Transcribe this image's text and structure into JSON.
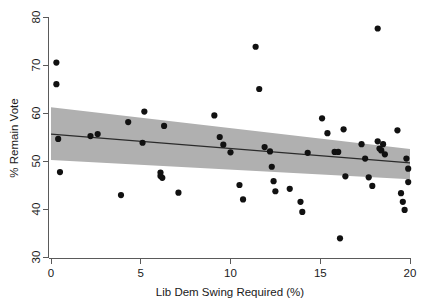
{
  "chart_data": {
    "type": "scatter",
    "title": "",
    "xlabel": "Lib Dem Swing Required (%)",
    "ylabel": "% Remain Vote",
    "xlim": [
      0,
      20
    ],
    "ylim": [
      30,
      80
    ],
    "xticks": [
      0,
      5,
      10,
      15,
      20
    ],
    "yticks": [
      30,
      40,
      50,
      60,
      70,
      80
    ],
    "xtick_labels": [
      "0",
      "5",
      "10",
      "15",
      "20"
    ],
    "ytick_labels": [
      "30",
      "40",
      "50",
      "60",
      "70",
      "80"
    ],
    "grid": false,
    "legend": "none",
    "marker_color": "#111111",
    "fit_line_color": "#2b2b2b",
    "ci_band_color": "#b0b0b0",
    "axis_color": "#5a5a5a",
    "background_color": "#ffffff",
    "points": [
      {
        "x": 0.3,
        "y": 70.5
      },
      {
        "x": 0.3,
        "y": 66.0
      },
      {
        "x": 0.4,
        "y": 54.6
      },
      {
        "x": 0.5,
        "y": 47.7
      },
      {
        "x": 2.2,
        "y": 55.2
      },
      {
        "x": 2.6,
        "y": 55.6
      },
      {
        "x": 3.9,
        "y": 42.9
      },
      {
        "x": 4.3,
        "y": 58.1
      },
      {
        "x": 5.1,
        "y": 53.8
      },
      {
        "x": 5.2,
        "y": 60.3
      },
      {
        "x": 6.1,
        "y": 47.6
      },
      {
        "x": 6.1,
        "y": 46.9
      },
      {
        "x": 6.2,
        "y": 46.5
      },
      {
        "x": 6.3,
        "y": 57.3
      },
      {
        "x": 7.1,
        "y": 43.4
      },
      {
        "x": 9.1,
        "y": 59.5
      },
      {
        "x": 9.4,
        "y": 55.0
      },
      {
        "x": 9.6,
        "y": 53.4
      },
      {
        "x": 10.0,
        "y": 51.8
      },
      {
        "x": 10.5,
        "y": 45.0
      },
      {
        "x": 10.7,
        "y": 42.0
      },
      {
        "x": 11.4,
        "y": 73.8
      },
      {
        "x": 11.6,
        "y": 65.0
      },
      {
        "x": 11.9,
        "y": 52.9
      },
      {
        "x": 12.2,
        "y": 52.0
      },
      {
        "x": 12.3,
        "y": 48.8
      },
      {
        "x": 12.4,
        "y": 45.8
      },
      {
        "x": 12.5,
        "y": 43.7
      },
      {
        "x": 13.3,
        "y": 44.2
      },
      {
        "x": 13.9,
        "y": 41.5
      },
      {
        "x": 14.0,
        "y": 39.4
      },
      {
        "x": 14.3,
        "y": 51.7
      },
      {
        "x": 15.1,
        "y": 58.9
      },
      {
        "x": 15.4,
        "y": 55.8
      },
      {
        "x": 15.8,
        "y": 51.9
      },
      {
        "x": 16.0,
        "y": 51.9
      },
      {
        "x": 16.1,
        "y": 33.9
      },
      {
        "x": 16.3,
        "y": 56.6
      },
      {
        "x": 16.4,
        "y": 46.8
      },
      {
        "x": 17.3,
        "y": 53.5
      },
      {
        "x": 17.5,
        "y": 50.5
      },
      {
        "x": 17.7,
        "y": 46.6
      },
      {
        "x": 17.9,
        "y": 44.8
      },
      {
        "x": 18.2,
        "y": 77.6
      },
      {
        "x": 18.2,
        "y": 54.1
      },
      {
        "x": 18.3,
        "y": 52.6
      },
      {
        "x": 18.4,
        "y": 52.2
      },
      {
        "x": 18.5,
        "y": 53.5
      },
      {
        "x": 18.6,
        "y": 51.4
      },
      {
        "x": 19.3,
        "y": 56.4
      },
      {
        "x": 19.5,
        "y": 43.3
      },
      {
        "x": 19.6,
        "y": 41.5
      },
      {
        "x": 19.7,
        "y": 39.8
      },
      {
        "x": 19.8,
        "y": 50.5
      },
      {
        "x": 19.9,
        "y": 45.6
      },
      {
        "x": 19.9,
        "y": 48.4
      }
    ],
    "fit_line": {
      "x0": 0.0,
      "y0": 55.6,
      "x1": 20.0,
      "y1": 49.6
    },
    "ci_band": {
      "x_start": 0.0,
      "x_end": 20.0,
      "upper_start": 61.2,
      "upper_end": 52.5,
      "lower_start": 50.2,
      "lower_end": 46.2
    }
  }
}
